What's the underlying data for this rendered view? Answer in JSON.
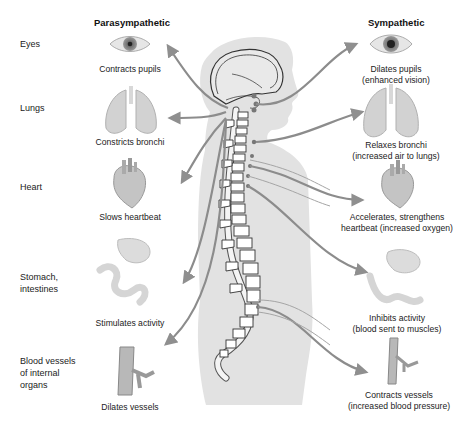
{
  "columns": {
    "parasympathetic_title": "Parasympathetic",
    "sympathetic_title": "Sympathetic"
  },
  "organs": [
    {
      "label": "Eyes",
      "icon": "eye-icon",
      "parasympathetic": "Contracts pupils",
      "sympathetic": [
        "Dilates pupils",
        "(enhanced vision)"
      ]
    },
    {
      "label": "Lungs",
      "icon": "lungs-icon",
      "parasympathetic": "Constricts bronchi",
      "sympathetic": [
        "Relaxes bronchi",
        "(increased air to lungs)"
      ]
    },
    {
      "label": "Heart",
      "icon": "heart-icon",
      "parasympathetic": "Slows heartbeat",
      "sympathetic": [
        "Accelerates, strengthens",
        "heartbeat (increased oxygen)"
      ]
    },
    {
      "label": [
        "Stomach,",
        "intestines"
      ],
      "icon": "stomach-intestines-icon",
      "parasympathetic": "Stimulates activity",
      "sympathetic": [
        "Inhibits activity",
        "(blood sent to muscles)"
      ]
    },
    {
      "label": [
        "Blood vessels",
        "of internal",
        "organs"
      ],
      "icon": "blood-vessel-icon",
      "parasympathetic": "Dilates vessels",
      "sympathetic": [
        "Contracts vessels",
        "(increased blood pressure)"
      ]
    }
  ],
  "colors": {
    "body_silhouette": "#e3e3e3",
    "nerve": "#8a8a8a",
    "organ_fill": "#c9c9c9",
    "text": "#222222"
  }
}
